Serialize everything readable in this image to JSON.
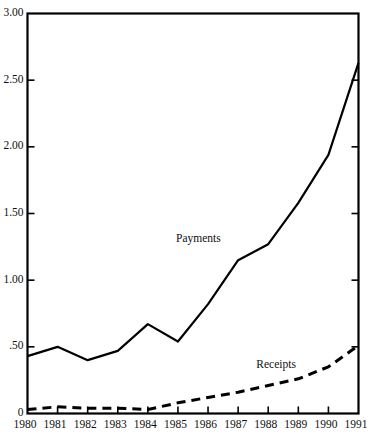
{
  "chart_data": {
    "type": "line",
    "title": "",
    "subtitle": "",
    "xlabel": "",
    "ylabel": "",
    "x": [
      1980,
      1981,
      1982,
      1983,
      1984,
      1985,
      1986,
      1987,
      1988,
      1989,
      1990,
      1991
    ],
    "categories": [
      "1980",
      "1981",
      "1982",
      "1983",
      "1984",
      "1985",
      "1986",
      "1987",
      "1988",
      "1989",
      "1990",
      "1991"
    ],
    "xlim": [
      1980,
      1991
    ],
    "ylim": [
      0,
      3.0
    ],
    "ytick_labels": [
      "3.00",
      "2.50",
      "2.00",
      "1.50",
      "1.00",
      ".50",
      "0"
    ],
    "ytick_values": [
      3.0,
      2.5,
      2.0,
      1.5,
      1.0,
      0.5,
      0
    ],
    "grid": false,
    "legend_position": "inline-annotation",
    "series": [
      {
        "name": "Payments",
        "style": "solid",
        "color": "#000000",
        "label_x": 1986.0,
        "label_y": 1.3,
        "values": [
          0.43,
          0.5,
          0.4,
          0.47,
          0.67,
          0.54,
          0.82,
          1.15,
          1.27,
          1.58,
          1.94,
          2.63
        ]
      },
      {
        "name": "Receipts",
        "style": "dashed",
        "color": "#000000",
        "label_x": 1988.6,
        "label_y": 0.36,
        "values": [
          0.03,
          0.05,
          0.04,
          0.04,
          0.03,
          0.08,
          0.12,
          0.16,
          0.21,
          0.26,
          0.35,
          0.51
        ]
      }
    ],
    "annotations": [
      {
        "text": "Payments",
        "series": "Payments"
      },
      {
        "text": "Receipts",
        "series": "Receipts"
      }
    ]
  },
  "axis": {
    "y_labels": [
      "3.00",
      "2.50",
      "2.00",
      "1.50",
      "1.00",
      ".50",
      "0"
    ],
    "x_labels": [
      "1980",
      "1981",
      "1982",
      "1983",
      "1984",
      "1985",
      "1986",
      "1987",
      "1988",
      "1989",
      "1990",
      "1991"
    ]
  },
  "colors": {
    "ink": "#000000",
    "background": "#ffffff"
  }
}
